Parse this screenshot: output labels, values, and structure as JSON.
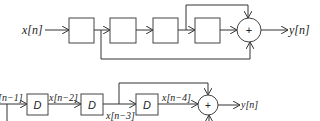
{
  "top_diagram": {
    "input_label": "x[n]",
    "output_label": "y[n]",
    "adder_symbol": "+",
    "delay_boxes": [
      "",
      "",
      "",
      ""
    ]
  },
  "bottom_diagram": {
    "input_label": "[n−1]",
    "delay_boxes": [
      "D",
      "D",
      "D"
    ],
    "signals": [
      "x[n−2]",
      "x[n−3]",
      "x[n−4]"
    ],
    "adder_symbol": "+",
    "output_label": "y[n]"
  }
}
